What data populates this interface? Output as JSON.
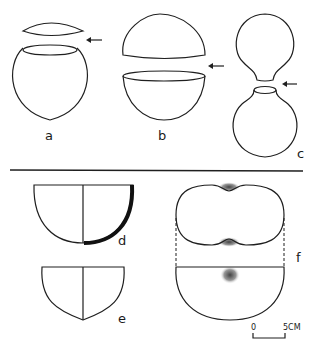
{
  "figure": {
    "panels": [
      {
        "id": "a",
        "label": "a",
        "desc": "spherical vessel with small cap lid, arrow at join"
      },
      {
        "id": "b",
        "label": "b",
        "desc": "hemispherical lid over hemispherical bowl, arrow at join"
      },
      {
        "id": "c",
        "label": "c",
        "desc": "two globular necked vessels mouth to mouth, arrow at join"
      },
      {
        "id": "d",
        "label": "d",
        "desc": "hemispherical bowl profile with thickened wall section"
      },
      {
        "id": "e",
        "label": "e",
        "desc": "pointed-base bowl profile"
      },
      {
        "id": "f",
        "label": "f",
        "desc": "plan and profile of double-lobed vessel with stippled shading"
      }
    ],
    "scale_bar": {
      "start": "0",
      "end": "5CM"
    },
    "colors": {
      "line": "#1f1f1f",
      "background": "#ffffff"
    }
  }
}
